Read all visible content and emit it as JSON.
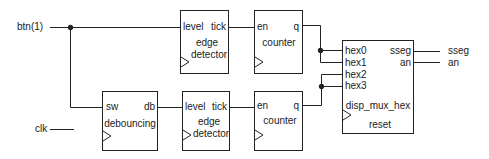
{
  "inputs": {
    "btn": "btn(1)",
    "clk": "clk"
  },
  "outputs": {
    "sseg": "sseg",
    "an": "an"
  },
  "blocks": {
    "edge1": {
      "in": "level",
      "out": "tick",
      "name1": "edge",
      "name2": "detector"
    },
    "counter1": {
      "in": "en",
      "out": "q",
      "name": "counter"
    },
    "debounce": {
      "in": "sw",
      "out": "db",
      "name": "debouncing"
    },
    "edge2": {
      "in": "level",
      "out": "tick",
      "name1": "edge",
      "name2": "detector"
    },
    "counter2": {
      "in": "en",
      "out": "q",
      "name": "counter"
    },
    "mux": {
      "ports": [
        "hex0",
        "hex1",
        "hex2",
        "hex3"
      ],
      "out1": "sseg",
      "out2": "an",
      "name": "disp_mux_hex",
      "reset": "reset"
    }
  },
  "colors": {
    "line": "#222222",
    "background": "#ffffff"
  }
}
